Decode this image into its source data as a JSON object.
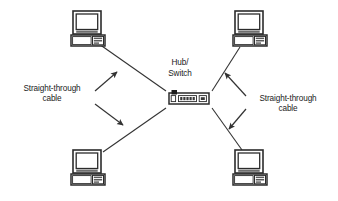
{
  "diagram": {
    "type": "network-topology",
    "topology": "star",
    "background_color": "#ffffff",
    "line_color": "#333333",
    "text_color": "#1a1a1a"
  },
  "center_device": {
    "name": "hub-switch",
    "label_line1": "Hub/",
    "label_line2": "Switch",
    "icon": "hub-switch-icon",
    "position": {
      "x": 169,
      "y": 93
    },
    "size": {
      "width": 40,
      "height": 14
    }
  },
  "nodes": [
    {
      "id": "computer-top-left",
      "icon": "computer-icon",
      "position": {
        "x": 71,
        "y": 11
      },
      "size": {
        "width": 34,
        "height": 38
      }
    },
    {
      "id": "computer-top-right",
      "icon": "computer-icon",
      "position": {
        "x": 233,
        "y": 11
      },
      "size": {
        "width": 34,
        "height": 38
      }
    },
    {
      "id": "computer-bottom-left",
      "icon": "computer-icon",
      "position": {
        "x": 71,
        "y": 150
      },
      "size": {
        "width": 34,
        "height": 38
      }
    },
    {
      "id": "computer-bottom-right",
      "icon": "computer-icon",
      "position": {
        "x": 233,
        "y": 150
      },
      "size": {
        "width": 34,
        "height": 38
      }
    }
  ],
  "connections": [
    {
      "id": "link-top-left",
      "from": "computer-top-left",
      "to": "hub-switch",
      "cable_type": "Straight-through cable"
    },
    {
      "id": "link-top-right",
      "from": "computer-top-right",
      "to": "hub-switch",
      "cable_type": "Straight-through cable"
    },
    {
      "id": "link-bottom-left",
      "from": "computer-bottom-left",
      "to": "hub-switch",
      "cable_type": "Straight-through cable"
    },
    {
      "id": "link-bottom-right",
      "from": "computer-bottom-right",
      "to": "hub-switch",
      "cable_type": "Straight-through cable"
    }
  ],
  "annotations": {
    "left": {
      "id": "annotation-left",
      "line1": "Straight-through",
      "line2": "cable",
      "arrows": [
        "arrow-up-right",
        "arrow-down-right"
      ]
    },
    "right": {
      "id": "annotation-right",
      "line1": "Straight-through",
      "line2": "cable",
      "arrows": [
        "arrow-up-left",
        "arrow-down-left"
      ]
    }
  }
}
